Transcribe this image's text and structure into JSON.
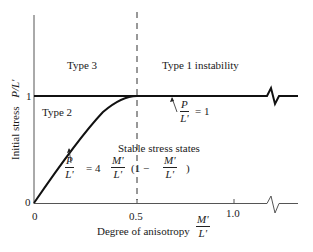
{
  "figure": {
    "y_axis": {
      "label_prefix": "Initial   stress",
      "label_symbol": "P/L'",
      "ticks": [
        {
          "value": "0",
          "label": "0"
        },
        {
          "value": "1",
          "label": "1"
        }
      ]
    },
    "x_axis": {
      "label_prefix": "Degree of anisotropy",
      "label_num": "M'",
      "label_den": "L'",
      "ticks": [
        {
          "value": "0",
          "label": "0"
        },
        {
          "value": "0.5",
          "label": "0.5"
        },
        {
          "value": "1.0",
          "label": "1.0"
        }
      ]
    },
    "regions": {
      "type3": "Type   3",
      "type2": "Type   2",
      "type1": "Type 1  instability",
      "stable": "Stable stress states"
    },
    "annotations": {
      "line_eq": {
        "num": "P",
        "den": "L'",
        "rhs": "= 1"
      },
      "curve_eq": {
        "lhs_num": "P",
        "lhs_den": "L'",
        "eq": "=  4",
        "m_num": "M'",
        "m_den": "L'",
        "paren_open": "(1 −",
        "m2_num": "M'",
        "m2_den": "L'",
        "paren_close": ")"
      }
    },
    "curves": {
      "boundary_line": "P/L' = 1",
      "parabola": "P/L' = 4 (M'/L') (1 - M'/L')",
      "divider": "M'/L' = 0.5 (dashed)"
    }
  }
}
